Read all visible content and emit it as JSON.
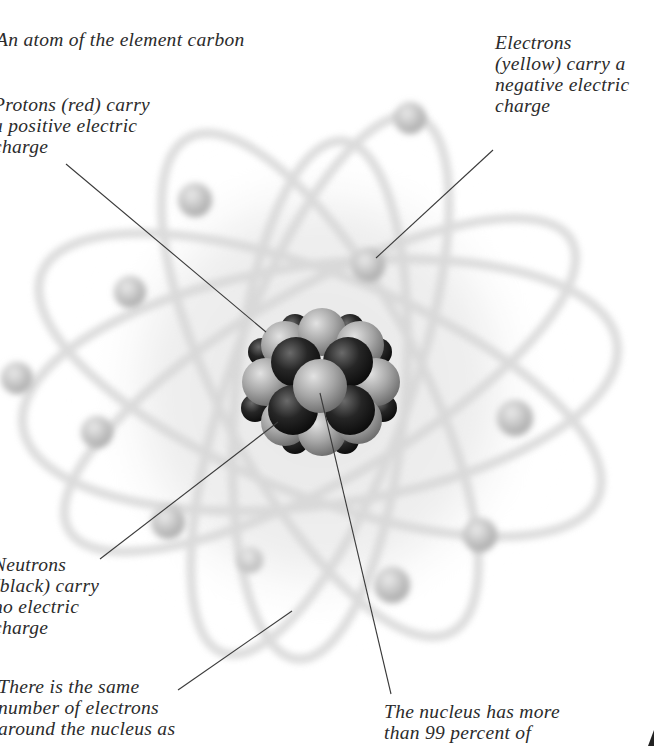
{
  "title": "An atom of the element carbon",
  "labels": {
    "electrons": {
      "lines": [
        "Electrons",
        "(yellow) carry a",
        "negative electric",
        "charge"
      ]
    },
    "protons": {
      "lines": [
        "Protons (red) carry",
        "a positive electric",
        "charge"
      ]
    },
    "neutrons": {
      "lines": [
        "Neutrons",
        "(black) carry",
        "no electric",
        "charge"
      ]
    },
    "same_number": {
      "lines": [
        "There is the same",
        "number of electrons",
        "around the nucleus as"
      ]
    },
    "nucleus": {
      "lines": [
        "The nucleus has more",
        "than 99 percent of"
      ]
    }
  },
  "colors": {
    "text": "#2b2b2b",
    "leader_line": "#3a3a3a",
    "orbit": "#d9d9d9",
    "electron": "#c4c4c4",
    "proton": "#a8a8a8",
    "neutron": "#1e1e1e",
    "cloud": "#eeeeee"
  }
}
